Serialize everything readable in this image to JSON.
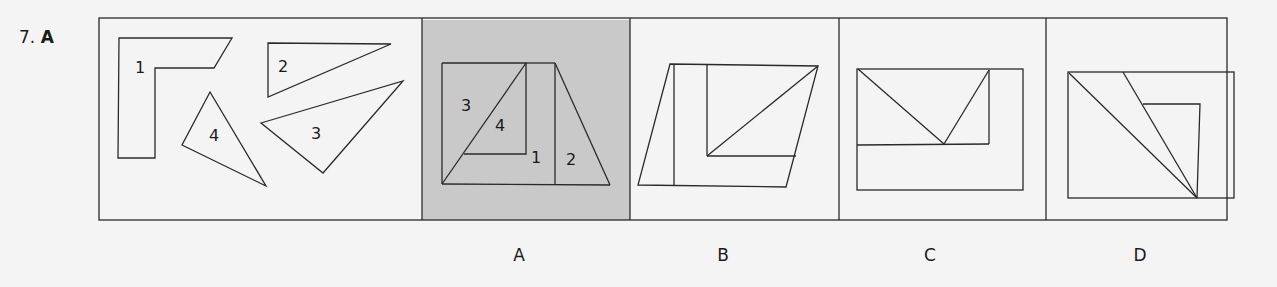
{
  "question": {
    "number": "7.",
    "answer": "A"
  },
  "pieces": {
    "labels": [
      "1",
      "2",
      "3",
      "4"
    ]
  },
  "options": [
    {
      "label": "A",
      "highlighted": true,
      "piece_labels": [
        "3",
        "4",
        "1",
        "2"
      ]
    },
    {
      "label": "B",
      "highlighted": false
    },
    {
      "label": "C",
      "highlighted": false
    },
    {
      "label": "D",
      "highlighted": false
    }
  ],
  "colors": {
    "background": "#f4f4f4",
    "highlight": "#c9c9c9",
    "stroke": "#2a2a2a"
  }
}
